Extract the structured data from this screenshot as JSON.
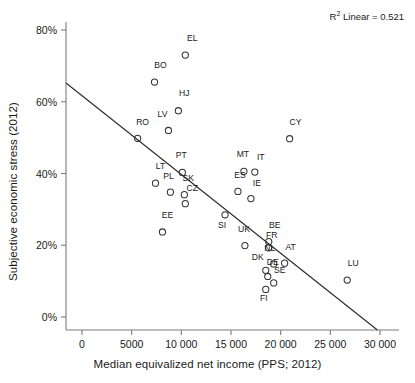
{
  "chart_data": {
    "type": "scatter",
    "title": "",
    "xlabel": "Median equivalized net income (PPS; 2012)",
    "ylabel": "Subjective economic stress (2012)",
    "annotation": "R² Linear = 0.521",
    "annotation_prefix": "R",
    "annotation_sup": "2",
    "annotation_suffix": " Linear = 0.521",
    "r_squared": 0.521,
    "xlim": [
      -2500,
      31500
    ],
    "ylim": [
      -5,
      86
    ],
    "xticks": [
      0,
      5000,
      10000,
      15000,
      20000,
      25000,
      30000
    ],
    "xticklabels": [
      "0",
      "5000",
      "10 000",
      "15 000",
      "20 000",
      "25 000",
      "30 000"
    ],
    "yticks": [
      0,
      20,
      40,
      60,
      80
    ],
    "yticklabels": [
      "0%",
      "20%",
      "40%",
      "60%",
      "80%"
    ],
    "grid": false,
    "legend": false,
    "marker_style": "open-circle",
    "fit_line": {
      "x_start": -2500,
      "y_start": 67.2,
      "x_end": 30000,
      "y_end": -4.2
    },
    "points": [
      {
        "label": "EL",
        "x": 10400,
        "y": 73.0,
        "lx": 11100,
        "ly": 76.8
      },
      {
        "label": "BO",
        "x": 7300,
        "y": 65.5,
        "lx": 7900,
        "ly": 69.5
      },
      {
        "label": "HJ",
        "x": 9700,
        "y": 57.5,
        "lx": 10300,
        "ly": 61.5
      },
      {
        "label": "LV",
        "x": 8700,
        "y": 52.0,
        "lx": 8100,
        "ly": 55.8
      },
      {
        "label": "RO",
        "x": 5600,
        "y": 49.8,
        "lx": 6100,
        "ly": 53.5
      },
      {
        "label": "CY",
        "x": 20900,
        "y": 49.7,
        "lx": 21500,
        "ly": 53.5
      },
      {
        "label": "MT",
        "x": 16300,
        "y": 40.6,
        "lx": 16200,
        "ly": 44.6
      },
      {
        "label": "IT",
        "x": 17400,
        "y": 40.4,
        "lx": 18000,
        "ly": 43.7
      },
      {
        "label": "PT",
        "x": 10100,
        "y": 40.3,
        "lx": 10000,
        "ly": 44.3
      },
      {
        "label": "LT",
        "x": 7400,
        "y": 37.3,
        "lx": 7900,
        "ly": 41.2
      },
      {
        "label": "ES",
        "x": 15700,
        "y": 35.0,
        "lx": 15900,
        "ly": 38.8
      },
      {
        "label": "PL",
        "x": 8900,
        "y": 34.8,
        "lx": 8700,
        "ly": 38.5
      },
      {
        "label": "SK",
        "x": 10300,
        "y": 34.1,
        "lx": 10700,
        "ly": 38.0
      },
      {
        "label": "IE",
        "x": 17000,
        "y": 33.0,
        "lx": 17600,
        "ly": 36.6
      },
      {
        "label": "CZ",
        "x": 10400,
        "y": 31.6,
        "lx": 11100,
        "ly": 35.2
      },
      {
        "label": "SI",
        "x": 14400,
        "y": 28.5,
        "lx": 14100,
        "ly": 24.8
      },
      {
        "label": "EE",
        "x": 8100,
        "y": 23.7,
        "lx": 8600,
        "ly": 27.5
      },
      {
        "label": "BE",
        "x": 18800,
        "y": 21.0,
        "lx": 19400,
        "ly": 24.9
      },
      {
        "label": "UK",
        "x": 16400,
        "y": 19.9,
        "lx": 16300,
        "ly": 23.6
      },
      {
        "label": "FR",
        "x": 18800,
        "y": 19.3,
        "lx": 19100,
        "ly": 22.0
      },
      {
        "label": "AT",
        "x": 20400,
        "y": 15.0,
        "lx": 21000,
        "ly": 18.8
      },
      {
        "label": "NL",
        "x": 19300,
        "y": 14.8,
        "lx": 18900,
        "ly": 18.3
      },
      {
        "label": "DK",
        "x": 18500,
        "y": 13.0,
        "lx": 17700,
        "ly": 16.0
      },
      {
        "label": "DE",
        "x": 18700,
        "y": 11.3,
        "lx": 19200,
        "ly": 14.4
      },
      {
        "label": "SE",
        "x": 19300,
        "y": 9.5,
        "lx": 19900,
        "ly": 12.3
      },
      {
        "label": "FI",
        "x": 18500,
        "y": 7.7,
        "lx": 18300,
        "ly": 4.4
      },
      {
        "label": "LU",
        "x": 26700,
        "y": 10.3,
        "lx": 27300,
        "ly": 14.1
      }
    ]
  },
  "colors": {
    "marker_stroke": "#333333",
    "fit_line": "#2b2b2b",
    "axis": "#7d7d7d",
    "text": "#1a1a1a",
    "background": "#ffffff"
  }
}
